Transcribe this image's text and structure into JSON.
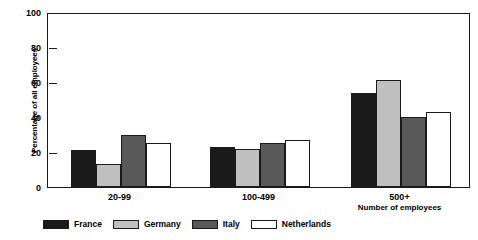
{
  "chart_data": {
    "type": "bar",
    "title": "",
    "xlabel": "Number of employees",
    "ylabel": "Percentage of all employees",
    "categories": [
      "20-99",
      "100-499",
      "500+"
    ],
    "ylim": [
      0,
      100
    ],
    "yticks": [
      0,
      20,
      40,
      60,
      80,
      100
    ],
    "grid": false,
    "legend_position": "bottom-left",
    "series": [
      {
        "name": "France",
        "color": "#1a1a1a",
        "values": [
          21,
          23,
          54
        ]
      },
      {
        "name": "Germany",
        "color": "#c0c0c0",
        "values": [
          13,
          22,
          61
        ]
      },
      {
        "name": "Italy",
        "color": "#595959",
        "values": [
          30,
          25,
          40
        ]
      },
      {
        "name": "Netherlands",
        "color": "#ffffff",
        "values": [
          25,
          27,
          43
        ]
      }
    ]
  },
  "axis": {
    "y_title": "Percentage of all employees",
    "x_title": "Number of employees",
    "y_tick_labels": [
      "0",
      "20",
      "40",
      "60",
      "80",
      "100"
    ]
  },
  "legend": {
    "items": [
      {
        "label": "France"
      },
      {
        "label": "Germany"
      },
      {
        "label": "Italy"
      },
      {
        "label": "Netherlands"
      }
    ]
  },
  "colors": {
    "axis": "#1a1a1a",
    "background": "#ffffff",
    "france": "#1a1a1a",
    "germany": "#c0c0c0",
    "italy": "#595959",
    "netherlands": "#ffffff"
  }
}
